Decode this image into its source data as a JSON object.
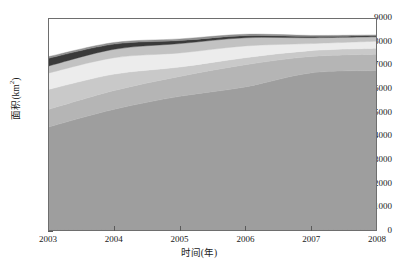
{
  "chart_data": {
    "type": "area",
    "stacked": true,
    "title": "",
    "xlabel": "时间(年)",
    "ylabel": "面积(km2)",
    "ylabel_display": "面积(km",
    "ylabel_sup": "2",
    "ylabel_tail": ")",
    "xlim": [
      2003,
      2008
    ],
    "ylim": [
      0,
      9000
    ],
    "grid": false,
    "legend": "none",
    "x": [
      2003,
      2004,
      2005,
      2006,
      2007,
      2008
    ],
    "xtick_labels": [
      "2003",
      "2004",
      "2005",
      "2006",
      "2007",
      "2008"
    ],
    "ytick_labels": [
      "0",
      "1000",
      "2000",
      "3000",
      "4000",
      "5000",
      "6000",
      "7000",
      "8000",
      "9000"
    ],
    "ytick_values": [
      0,
      1000,
      2000,
      3000,
      4000,
      5000,
      6000,
      7000,
      8000,
      9000
    ],
    "series": [
      {
        "name": "band-1",
        "color": "#9e9e9e",
        "values": [
          4400,
          5150,
          5700,
          6100,
          6700,
          6800
        ]
      },
      {
        "name": "band-2",
        "color": "#b5b5b5",
        "values": [
          750,
          800,
          850,
          950,
          700,
          700
        ]
      },
      {
        "name": "band-3",
        "color": "#c9c9c9",
        "values": [
          850,
          700,
          400,
          300,
          250,
          250
        ]
      },
      {
        "name": "band-4",
        "color": "#ececec",
        "values": [
          700,
          700,
          600,
          500,
          300,
          300
        ]
      },
      {
        "name": "band-5",
        "color": "#c2c2c2",
        "values": [
          300,
          360,
          400,
          350,
          250,
          190
        ]
      },
      {
        "name": "band-6",
        "color": "#3a3a3a",
        "values": [
          330,
          220,
          130,
          90,
          60,
          50
        ]
      },
      {
        "name": "band-7",
        "color": "#8f8f8f",
        "values": [
          70,
          70,
          70,
          60,
          40,
          30
        ]
      }
    ],
    "cumulative_top": [
      7400,
      8000,
      8150,
      8350,
      8300,
      8320
    ]
  },
  "axes": {
    "frame_color": "#6e6e6e",
    "tick_color": "#5a5a5a",
    "background": "#ffffff"
  }
}
